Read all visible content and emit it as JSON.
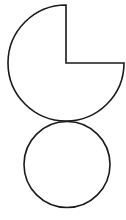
{
  "diagram": {
    "background": "#ffffff",
    "stroke_color": "#1a1a1a",
    "stroke_width": 1.6,
    "shapes": [
      {
        "name": "three-quarter-circle",
        "type": "sector",
        "center": [
          66,
          63
        ],
        "radius": 58,
        "missing_quadrant": "top-right",
        "fill": "#ffffff"
      },
      {
        "name": "full-circle",
        "type": "circle",
        "center": [
          67,
          164.5
        ],
        "radius": 43,
        "fill": "#ffffff"
      }
    ]
  }
}
